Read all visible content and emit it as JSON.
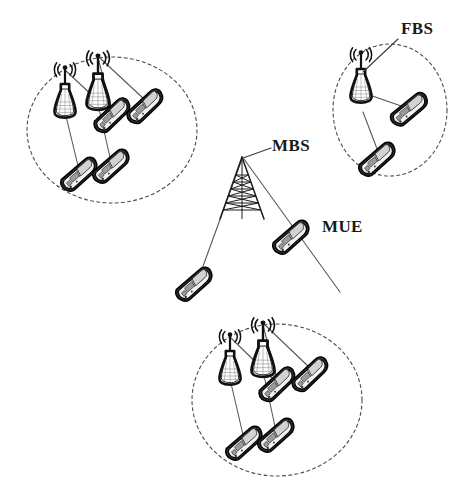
{
  "figure": {
    "width": 463,
    "height": 484,
    "background": "#ffffff"
  },
  "labels": {
    "fbs": "FBS",
    "mbs": "MBS",
    "mue": "MUE"
  },
  "legend_meaning": {
    "fbs": "Femto Base Station",
    "mbs": "Macro Base Station",
    "mue": "Macro User Equipment"
  },
  "colors": {
    "stroke": "#111111",
    "cell_boundary": "#4a4a4a",
    "link": "#555555",
    "label": "#1a1a1a",
    "phone_body": "#2b2b2b",
    "phone_face": "#f2f2f2",
    "phone_screen": "#d2d2d2",
    "background": "#ffffff"
  },
  "cells": [
    {
      "id": "femto-cell-top-left",
      "name": "top-left femto cell",
      "ellipse": {
        "cx": 112,
        "cy": 130,
        "rx": 85,
        "ry": 73
      },
      "base_stations": [
        {
          "id": "fbs-tl-1",
          "x": 65,
          "y": 88,
          "scale": 1.0
        },
        {
          "id": "fbs-tl-2",
          "x": 98,
          "y": 78,
          "scale": 1.08
        }
      ],
      "user_equipment": [
        {
          "id": "fue-tl-1",
          "x": 113,
          "y": 116,
          "rot": -32,
          "scale": 1.0
        },
        {
          "id": "fue-tl-2",
          "x": 146,
          "y": 107,
          "rot": -32,
          "scale": 1.0
        },
        {
          "id": "fue-tl-3",
          "x": 80,
          "y": 175,
          "rot": -30,
          "scale": 1.0
        },
        {
          "id": "fue-tl-4",
          "x": 112,
          "y": 167,
          "rot": -30,
          "scale": 1.0
        }
      ],
      "links": [
        {
          "from": "fbs-tl-1",
          "to": "fue-tl-1"
        },
        {
          "from": "fbs-tl-2",
          "to": "fue-tl-1"
        },
        {
          "from": "fbs-tl-2",
          "to": "fue-tl-2"
        },
        {
          "from": "fbs-tl-1",
          "to": "fue-tl-3"
        },
        {
          "from": "fbs-tl-2",
          "to": "fue-tl-4"
        }
      ]
    },
    {
      "id": "femto-cell-top-right",
      "name": "top-right femto cell",
      "ellipse": {
        "cx": 390,
        "cy": 110,
        "rx": 57,
        "ry": 66
      },
      "base_stations": [
        {
          "id": "fbs-tr-1",
          "x": 361,
          "y": 73,
          "scale": 1.0
        }
      ],
      "user_equipment": [
        {
          "id": "fue-tr-1",
          "x": 410,
          "y": 110,
          "rot": -28,
          "scale": 1.0
        },
        {
          "id": "fue-tr-2",
          "x": 378,
          "y": 160,
          "rot": -30,
          "scale": 1.0
        }
      ],
      "links": [
        {
          "from": "fbs-tr-1",
          "to": "fue-tr-1"
        },
        {
          "from": "fbs-tr-1",
          "to": "fue-tr-2"
        }
      ]
    },
    {
      "id": "femto-cell-bottom",
      "name": "bottom femto cell",
      "ellipse": {
        "cx": 277,
        "cy": 400,
        "rx": 85,
        "ry": 76
      },
      "base_stations": [
        {
          "id": "fbs-b-1",
          "x": 230,
          "y": 355,
          "scale": 1.0
        },
        {
          "id": "fbs-b-2",
          "x": 263,
          "y": 345,
          "scale": 1.08
        }
      ],
      "user_equipment": [
        {
          "id": "fue-b-1",
          "x": 278,
          "y": 385,
          "rot": -32,
          "scale": 1.0
        },
        {
          "id": "fue-b-2",
          "x": 311,
          "y": 375,
          "rot": -32,
          "scale": 1.0
        },
        {
          "id": "fue-b-3",
          "x": 245,
          "y": 444,
          "rot": -30,
          "scale": 1.0
        },
        {
          "id": "fue-b-4",
          "x": 277,
          "y": 436,
          "rot": -30,
          "scale": 1.0
        }
      ],
      "links": [
        {
          "from": "fbs-b-1",
          "to": "fue-b-1"
        },
        {
          "from": "fbs-b-2",
          "to": "fue-b-1"
        },
        {
          "from": "fbs-b-2",
          "to": "fue-b-2"
        },
        {
          "from": "fbs-b-1",
          "to": "fue-b-3"
        },
        {
          "from": "fbs-b-2",
          "to": "fue-b-4"
        }
      ]
    }
  ],
  "macro": {
    "id": "mbs-tower",
    "name": "macro base station tower",
    "apex": {
      "x": 242,
      "y": 157
    },
    "base_left": {
      "x": 221,
      "y": 218
    },
    "base_right": {
      "x": 263,
      "y": 218
    },
    "user_equipment": [
      {
        "id": "mue-1",
        "x": 195,
        "y": 285,
        "rot": -30,
        "scale": 1.05
      },
      {
        "id": "mue-2",
        "x": 292,
        "y": 238,
        "rot": -30,
        "scale": 1.05
      }
    ],
    "links": [
      {
        "from": "mbs-tower",
        "to": "mue-1"
      },
      {
        "from": "mbs-tower",
        "to": "mue-2"
      }
    ]
  },
  "callouts": [
    {
      "id": "callout-fbs",
      "label": "FBS",
      "text_x": 401,
      "text_y": 33,
      "line": {
        "x1": 397,
        "y1": 38,
        "x2": 365,
        "y2": 73
      }
    },
    {
      "id": "callout-mbs",
      "label": "MBS",
      "text_x": 272,
      "text_y": 150,
      "line": {
        "x1": 269,
        "y1": 153,
        "x2": 243,
        "y2": 160
      }
    },
    {
      "id": "callout-mue",
      "label": "MUE",
      "text_x": 322,
      "text_y": 231,
      "line": null
    }
  ]
}
